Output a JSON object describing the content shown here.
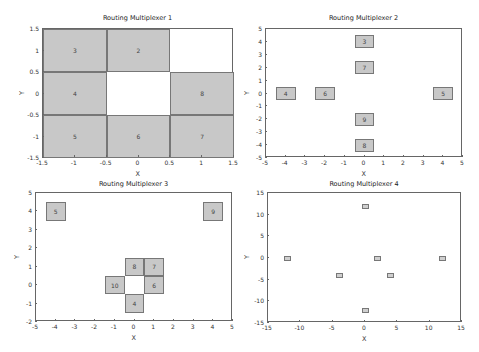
{
  "chart_data": [
    {
      "type": "heatmap",
      "title": "Routing Multiplexer 1",
      "xlabel": "X",
      "ylabel": "Y",
      "xlim": [
        -1.5,
        1.5
      ],
      "ylim": [
        -1.5,
        1.5
      ],
      "xticks": [
        "-1.5",
        "-1",
        "-0.5",
        "0",
        "0.5",
        "1",
        "1.5"
      ],
      "yticks": [
        "1.5",
        "1",
        "0.5",
        "0",
        "-0.5",
        "-1",
        "-1.5"
      ],
      "grid": false,
      "cells": [
        {
          "label": "3",
          "x": -1,
          "y": 1,
          "w": 1,
          "h": 1
        },
        {
          "label": "2",
          "x": 0,
          "y": 1,
          "w": 1,
          "h": 1
        },
        {
          "label": "4",
          "x": -1,
          "y": 0,
          "w": 1,
          "h": 1
        },
        {
          "label": "8",
          "x": 1,
          "y": 0,
          "w": 1,
          "h": 1
        },
        {
          "label": "5",
          "x": -1,
          "y": -1,
          "w": 1,
          "h": 1
        },
        {
          "label": "6",
          "x": 0,
          "y": -1,
          "w": 1,
          "h": 1
        },
        {
          "label": "7",
          "x": 1,
          "y": -1,
          "w": 1,
          "h": 1
        }
      ]
    },
    {
      "type": "scatter",
      "title": "Routing Multiplexer 2",
      "xlabel": "X",
      "ylabel": "Y",
      "xlim": [
        -5,
        5
      ],
      "ylim": [
        -5,
        5
      ],
      "xticks": [
        "-5",
        "-4",
        "-3",
        "-2",
        "-1",
        "0",
        "1",
        "2",
        "3",
        "4",
        "5"
      ],
      "yticks": [
        "5",
        "4",
        "3",
        "2",
        "1",
        "0",
        "-1",
        "-2",
        "-3",
        "-4",
        "-5"
      ],
      "grid": false,
      "cells": [
        {
          "label": "3",
          "x": 0,
          "y": 4,
          "w": 1,
          "h": 1
        },
        {
          "label": "7",
          "x": 0,
          "y": 2,
          "w": 1,
          "h": 1
        },
        {
          "label": "4",
          "x": -4,
          "y": 0,
          "w": 1,
          "h": 1
        },
        {
          "label": "6",
          "x": -2,
          "y": 0,
          "w": 1,
          "h": 1
        },
        {
          "label": "5",
          "x": 4,
          "y": 0,
          "w": 1,
          "h": 1
        },
        {
          "label": "9",
          "x": 0,
          "y": -2,
          "w": 1,
          "h": 1
        },
        {
          "label": "8",
          "x": 0,
          "y": -4,
          "w": 1,
          "h": 1
        }
      ]
    },
    {
      "type": "scatter",
      "title": "Routing Multiplexer 3",
      "xlabel": "X",
      "ylabel": "Y",
      "xlim": [
        -5,
        5
      ],
      "ylim": [
        -2,
        5
      ],
      "xticks": [
        "-5",
        "-4",
        "-3",
        "-2",
        "-1",
        "0",
        "1",
        "2",
        "3",
        "4",
        "5"
      ],
      "yticks": [
        "5",
        "4",
        "3",
        "2",
        "1",
        "0",
        "-1",
        "-2"
      ],
      "grid": false,
      "cells": [
        {
          "label": "5",
          "x": -4,
          "y": 4,
          "w": 1,
          "h": 1
        },
        {
          "label": "9",
          "x": 4,
          "y": 4,
          "w": 1,
          "h": 1
        },
        {
          "label": "8",
          "x": 0,
          "y": 1,
          "w": 1,
          "h": 1
        },
        {
          "label": "7",
          "x": 1,
          "y": 1,
          "w": 1,
          "h": 1
        },
        {
          "label": "10",
          "x": -1,
          "y": 0,
          "w": 1,
          "h": 1
        },
        {
          "label": "6",
          "x": 1,
          "y": 0,
          "w": 1,
          "h": 1
        },
        {
          "label": "4",
          "x": 0,
          "y": -1,
          "w": 1,
          "h": 1
        }
      ]
    },
    {
      "type": "scatter",
      "title": "Routing Multiplexer 4",
      "xlabel": "X",
      "ylabel": "Y",
      "xlim": [
        -15,
        15
      ],
      "ylim": [
        -15,
        15
      ],
      "xticks": [
        "-15",
        "-10",
        "-5",
        "0",
        "5",
        "10",
        "15"
      ],
      "yticks": [
        "15",
        "10",
        "5",
        "0",
        "-5",
        "-10",
        "-15"
      ],
      "grid": false,
      "cells": [
        {
          "label": "",
          "x": 0,
          "y": 12,
          "w": 1,
          "h": 1
        },
        {
          "label": "",
          "x": -12,
          "y": 0,
          "w": 1,
          "h": 1
        },
        {
          "label": "",
          "x": 2,
          "y": 0,
          "w": 1,
          "h": 1
        },
        {
          "label": "",
          "x": 12,
          "y": 0,
          "w": 1,
          "h": 1
        },
        {
          "label": "",
          "x": -4,
          "y": -4,
          "w": 1,
          "h": 1
        },
        {
          "label": "",
          "x": 4,
          "y": -4,
          "w": 1,
          "h": 1
        },
        {
          "label": "",
          "x": 0,
          "y": -12,
          "w": 1,
          "h": 1
        }
      ]
    }
  ],
  "layout": {
    "panels": [
      {
        "left": 42,
        "top": 28,
        "right": 233,
        "bottom": 157,
        "title_y": 14,
        "xlabel_y": 170,
        "ylabel_x": 20
      },
      {
        "left": 265,
        "top": 28,
        "right": 462,
        "bottom": 157,
        "title_y": 14,
        "xlabel_y": 170,
        "ylabel_x": 245
      },
      {
        "left": 35,
        "top": 192,
        "right": 232,
        "bottom": 321,
        "title_y": 180,
        "xlabel_y": 334,
        "ylabel_x": 15
      },
      {
        "left": 267,
        "top": 192,
        "right": 461,
        "bottom": 322,
        "title_y": 180,
        "xlabel_y": 335,
        "ylabel_x": 245
      }
    ]
  }
}
